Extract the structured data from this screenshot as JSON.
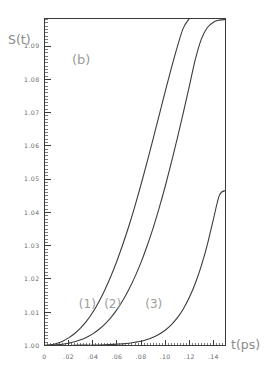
{
  "chart_data": {
    "type": "line",
    "title": "",
    "panel_label": "(b)",
    "xlabel": "t(ps)",
    "ylabel": "S(t)",
    "xlim": [
      0,
      0.15
    ],
    "ylim": [
      1.0,
      1.0983
    ],
    "grid": false,
    "legend_position": "inline-curve-labels",
    "x_ticks": [
      0,
      0.02,
      0.04,
      0.06,
      0.08,
      0.1,
      0.12,
      0.14
    ],
    "x_tick_labels": [
      "0",
      ".02",
      ".04",
      ".06",
      ".08",
      ".10",
      ".12",
      ".14"
    ],
    "y_ticks": [
      1.0,
      1.01,
      1.02,
      1.03,
      1.04,
      1.05,
      1.06,
      1.07,
      1.08,
      1.09
    ],
    "y_tick_labels": [
      "1.00",
      "1.01",
      "1.02",
      "1.03",
      "1.04",
      "1.05",
      "1.06",
      "1.07",
      "1.08",
      "1.09"
    ],
    "x_minor_step": 0.0025,
    "y_minor_step": 0.001,
    "series": [
      {
        "name": "(1)",
        "label": "(1)",
        "label_x": 0.0355,
        "label_y": 1.0112,
        "color": "#3c3c3c",
        "x": [
          0.0,
          0.005,
          0.01,
          0.015,
          0.02,
          0.025,
          0.03,
          0.035,
          0.04,
          0.045,
          0.05,
          0.055,
          0.06,
          0.065,
          0.07,
          0.075,
          0.08,
          0.085,
          0.09,
          0.095,
          0.1,
          0.105,
          0.11,
          0.115,
          0.12,
          0.125,
          0.13,
          0.135,
          0.14,
          0.145,
          0.15
        ],
        "y": [
          1.0,
          1.0002,
          1.0006,
          1.0013,
          1.0023,
          1.0036,
          1.0053,
          1.0074,
          1.01,
          1.0131,
          1.0167,
          1.0208,
          1.0254,
          1.0305,
          1.036,
          1.042,
          1.0484,
          1.0551,
          1.0621,
          1.0692,
          1.0763,
          1.0832,
          1.0897,
          1.0954,
          1.0998,
          1.1026,
          1.1036,
          1.1029,
          1.1006,
          1.0975,
          1.0944
        ]
      },
      {
        "name": "(2)",
        "label": "(2)",
        "label_x": 0.0565,
        "label_y": 1.0112,
        "color": "#3c3c3c",
        "x": [
          0.0,
          0.005,
          0.01,
          0.015,
          0.02,
          0.025,
          0.03,
          0.035,
          0.04,
          0.045,
          0.05,
          0.055,
          0.06,
          0.065,
          0.07,
          0.075,
          0.08,
          0.085,
          0.09,
          0.095,
          0.1,
          0.105,
          0.11,
          0.115,
          0.12,
          0.125,
          0.13,
          0.135,
          0.14,
          0.145,
          0.15
        ],
        "y": [
          1.0,
          1.0001,
          1.0002,
          1.0004,
          1.0007,
          1.0011,
          1.0017,
          1.0025,
          1.0035,
          1.0048,
          1.0064,
          1.0084,
          1.0108,
          1.0136,
          1.0169,
          1.0207,
          1.025,
          1.0299,
          1.0353,
          1.0413,
          1.0478,
          1.0548,
          1.0622,
          1.0699,
          1.0779,
          1.086,
          1.0921,
          1.0956,
          1.0972,
          1.0978,
          1.098
        ]
      },
      {
        "name": "(3)",
        "label": "(3)",
        "label_x": 0.0905,
        "label_y": 1.0112,
        "color": "#3c3c3c",
        "x": [
          0.0,
          0.01,
          0.02,
          0.03,
          0.04,
          0.05,
          0.06,
          0.065,
          0.07,
          0.075,
          0.08,
          0.085,
          0.09,
          0.095,
          0.1,
          0.105,
          0.11,
          0.115,
          0.12,
          0.125,
          0.13,
          0.135,
          0.14,
          0.145,
          0.15
        ],
        "y": [
          1.0,
          1.0,
          1.0,
          1.0001,
          1.0001,
          1.0002,
          1.0004,
          1.0005,
          1.0007,
          1.001,
          1.0013,
          1.0018,
          1.0025,
          1.0034,
          1.0046,
          1.0062,
          1.0083,
          1.011,
          1.0144,
          1.0187,
          1.024,
          1.0304,
          1.038,
          1.0452,
          1.0466
        ]
      }
    ]
  },
  "labels": {
    "y_axis_title": "S(t)",
    "x_axis_title": "t(ps)",
    "panel": "(b)"
  }
}
